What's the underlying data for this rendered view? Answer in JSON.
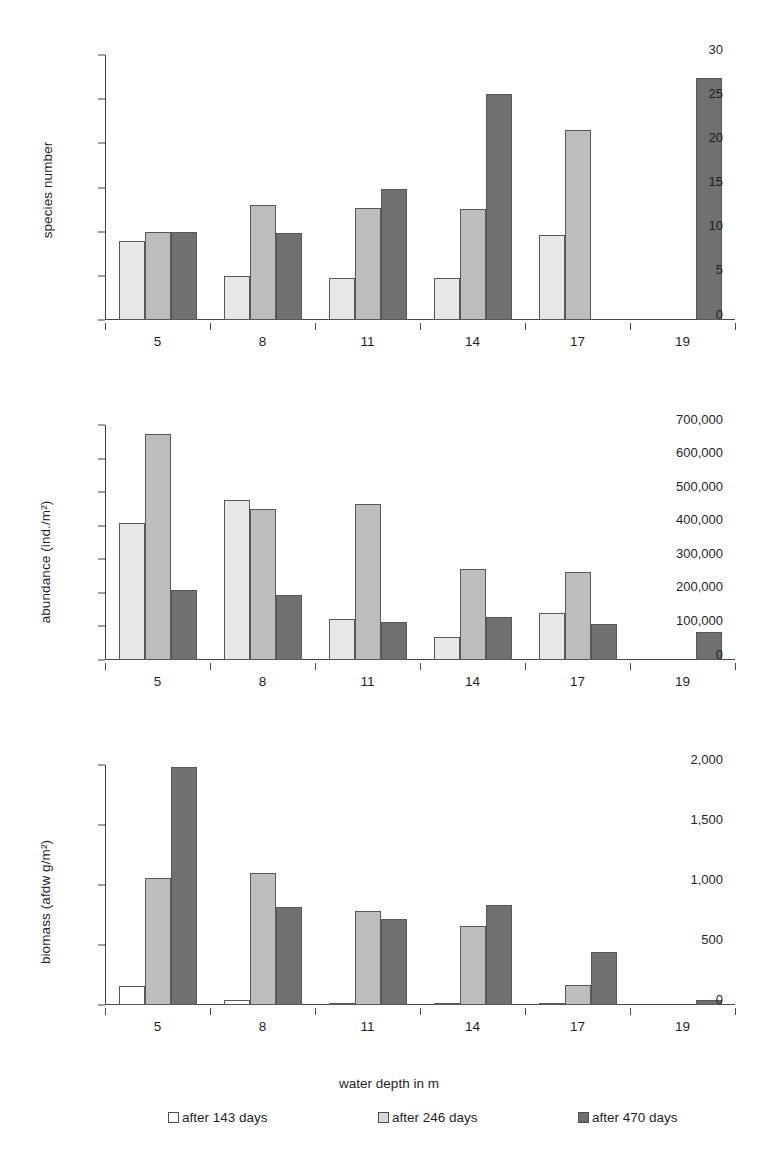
{
  "figure": {
    "xlabel": "water depth in m",
    "categories": [
      "5",
      "8",
      "11",
      "14",
      "17",
      "19"
    ],
    "legend": [
      {
        "label": "after 143 days",
        "swatch": "white",
        "color": "#ffffff"
      },
      {
        "label": "after 246 days",
        "swatch": "light-gray",
        "color": "#d9d9d9"
      },
      {
        "label": "after 470 days",
        "swatch": "dark-gray",
        "color": "#6e6e6e"
      }
    ]
  },
  "chart_data": [
    {
      "type": "bar",
      "title": "",
      "xlabel": "water depth in m",
      "ylabel": "species number",
      "categories": [
        "5",
        "8",
        "11",
        "14",
        "17",
        "19"
      ],
      "ylim": [
        0,
        30
      ],
      "yticks": [
        0,
        5,
        10,
        15,
        20,
        25,
        30
      ],
      "ytick_labels": [
        "0",
        "5",
        "10",
        "15",
        "20",
        "25",
        "30"
      ],
      "grid": false,
      "legend_position": "bottom",
      "series": [
        {
          "name": "after 143 days",
          "values": [
            9,
            5,
            4.8,
            4.7,
            9.6,
            null
          ]
        },
        {
          "name": "after 246 days",
          "values": [
            10,
            13,
            12.7,
            12.6,
            21.5,
            null
          ]
        },
        {
          "name": "after 470 days",
          "values": [
            10,
            9.8,
            14.8,
            25.6,
            null,
            27.4
          ]
        }
      ]
    },
    {
      "type": "bar",
      "title": "",
      "xlabel": "water depth in m",
      "ylabel": "abundance (ind./m²)",
      "categories": [
        "5",
        "8",
        "11",
        "14",
        "17",
        "19"
      ],
      "ylim": [
        0,
        700000
      ],
      "yticks": [
        0,
        100000,
        200000,
        300000,
        400000,
        500000,
        600000,
        700000
      ],
      "ytick_labels": [
        "0",
        "100,000",
        "200,000",
        "300,000",
        "400,000",
        "500,000",
        "600,000",
        "700,000"
      ],
      "grid": false,
      "legend_position": "bottom",
      "series": [
        {
          "name": "after 143 days",
          "values": [
            408000,
            477000,
            122000,
            69000,
            139000,
            null
          ]
        },
        {
          "name": "after 246 days",
          "values": [
            672000,
            449000,
            464000,
            271000,
            262000,
            null
          ]
        },
        {
          "name": "after 470 days",
          "values": [
            210000,
            194000,
            113000,
            128000,
            107000,
            83000
          ]
        }
      ]
    },
    {
      "type": "bar",
      "title": "",
      "xlabel": "water depth in m",
      "ylabel": "biomass (afdw g/m²)",
      "categories": [
        "5",
        "8",
        "11",
        "14",
        "17",
        "19"
      ],
      "ylim": [
        0,
        2000
      ],
      "yticks": [
        0,
        500,
        1000,
        1500,
        2000
      ],
      "ytick_labels": [
        "0",
        "500",
        "1,000",
        "1,500",
        "2,000"
      ],
      "grid": false,
      "legend_position": "bottom",
      "series": [
        {
          "name": "after 143 days",
          "values": [
            160,
            38,
            15,
            8,
            15,
            null
          ]
        },
        {
          "name": "after 246 days",
          "values": [
            1060,
            1100,
            780,
            655,
            170,
            null
          ]
        },
        {
          "name": "after 470 days",
          "values": [
            1985,
            820,
            715,
            835,
            440,
            45
          ]
        }
      ]
    }
  ]
}
